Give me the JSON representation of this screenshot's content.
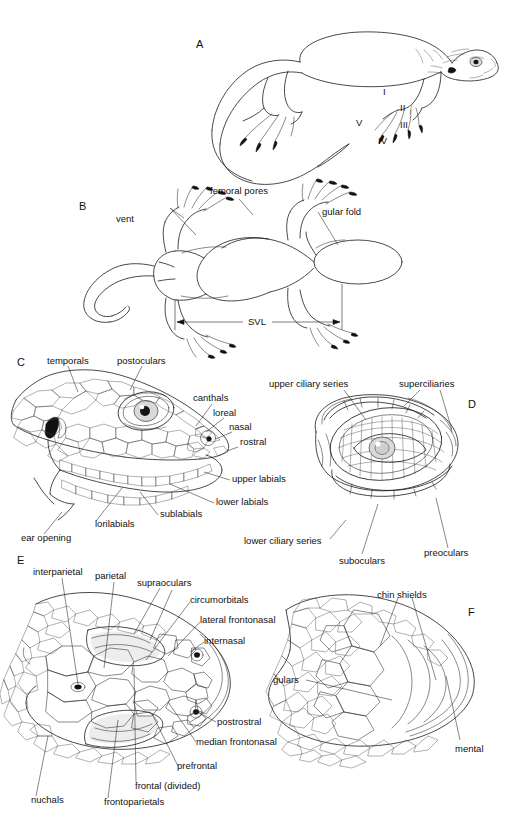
{
  "figure": {
    "background_color": "#ffffff",
    "ink_color": "#1a1a1a"
  },
  "panels": [
    {
      "id": "A",
      "letter": "A",
      "caption": "lateral whole-body view",
      "labels": [
        {
          "name": "digit-i",
          "text": "I"
        },
        {
          "name": "digit-ii",
          "text": "II"
        },
        {
          "name": "digit-iii",
          "text": "III"
        },
        {
          "name": "digit-iv",
          "text": "IV"
        },
        {
          "name": "digit-v",
          "text": "V"
        }
      ]
    },
    {
      "id": "B",
      "letter": "B",
      "caption": "ventral whole-body view with snout-vent length",
      "labels": [
        {
          "name": "femoral-pores",
          "text": "femoral pores"
        },
        {
          "name": "vent",
          "text": "vent"
        },
        {
          "name": "gular-fold",
          "text": "gular fold"
        },
        {
          "name": "svl",
          "text": "SVL"
        }
      ]
    },
    {
      "id": "C",
      "letter": "C",
      "caption": "lateral head scalation",
      "labels": [
        {
          "name": "temporals",
          "text": "temporals"
        },
        {
          "name": "postoculars",
          "text": "postoculars"
        },
        {
          "name": "canthals",
          "text": "canthals"
        },
        {
          "name": "loreal",
          "text": "loreal"
        },
        {
          "name": "nasal",
          "text": "nasal"
        },
        {
          "name": "rostral",
          "text": "rostral"
        },
        {
          "name": "upper-labials",
          "text": "upper labials"
        },
        {
          "name": "lower-labials",
          "text": "lower labials"
        },
        {
          "name": "sublabials",
          "text": "sublabials"
        },
        {
          "name": "lorilabials",
          "text": "lorilabials"
        },
        {
          "name": "ear-opening",
          "text": "ear opening"
        }
      ]
    },
    {
      "id": "D",
      "letter": "D",
      "caption": "close-up of eye and circumocular scales",
      "labels": [
        {
          "name": "upper-ciliary-series",
          "text": "upper ciliary series"
        },
        {
          "name": "superciliaries",
          "text": "superciliaries"
        },
        {
          "name": "lower-ciliary-series",
          "text": "lower ciliary series"
        },
        {
          "name": "suboculars",
          "text": "suboculars"
        },
        {
          "name": "preoculars",
          "text": "preoculars"
        }
      ]
    },
    {
      "id": "E",
      "letter": "E",
      "caption": "dorsal head scalation",
      "labels": [
        {
          "name": "interparietal",
          "text": "interparietal"
        },
        {
          "name": "parietal",
          "text": "parietal"
        },
        {
          "name": "supraoculars",
          "text": "supraoculars"
        },
        {
          "name": "circumorbitals",
          "text": "circumorbitals"
        },
        {
          "name": "lateral-frontonasal",
          "text": "lateral frontonasal"
        },
        {
          "name": "internasal",
          "text": "internasal"
        },
        {
          "name": "postrostral",
          "text": "postrostral"
        },
        {
          "name": "median-frontonasal",
          "text": "median frontonasal"
        },
        {
          "name": "prefrontal",
          "text": "prefrontal"
        },
        {
          "name": "frontal-divided",
          "text": "frontal (divided)"
        },
        {
          "name": "frontoparietals",
          "text": "frontoparietals"
        },
        {
          "name": "nuchals",
          "text": "nuchals"
        }
      ]
    },
    {
      "id": "F",
      "letter": "F",
      "caption": "ventral head scalation",
      "labels": [
        {
          "name": "chin-shields",
          "text": "chin shields"
        },
        {
          "name": "gulars",
          "text": "gulars"
        },
        {
          "name": "mental",
          "text": "mental"
        }
      ]
    }
  ]
}
